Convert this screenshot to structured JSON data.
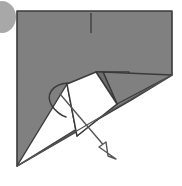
{
  "figure": {
    "type": "origami-step",
    "canvas": {
      "width": 182,
      "height": 186,
      "background": "#ffffff"
    },
    "palette": {
      "paper_front": "#808080",
      "paper_shadow": "#6e6e6e",
      "paper_back": "#ffffff",
      "outline": "#3a3a3a",
      "marker_circle": "#a8a8a8",
      "arrow_stroke": "#555555"
    },
    "shapes": {
      "marker_circle": {
        "label": "step-marker-circle",
        "cx": 2,
        "cy": 17,
        "rx": 14,
        "ry": 16,
        "fill": "#a8a8a8"
      },
      "main_sheet": {
        "label": "folded-paper-body",
        "points": "17,11 172,11 172,75 131,100 17,166",
        "fill": "#808080",
        "stroke": "#3a3a3a"
      },
      "crease_mark": {
        "label": "vertical-crease-mark",
        "x1": 91,
        "y1": 13,
        "x2": 91,
        "y2": 33,
        "stroke": "#3a3a3a"
      },
      "white_flap_main": {
        "label": "white-flap-kite",
        "points": "67,84 96,72 117,104 77,136",
        "fill": "#ffffff",
        "stroke": "#3a3a3a"
      },
      "white_flap_left": {
        "label": "white-flap-lower-wedge",
        "points": "17,166 67,84 77,136 117,104",
        "fill": "#ffffff",
        "stroke": "#3a3a3a"
      },
      "white_flap_right": {
        "label": "white-flap-right-wedge",
        "points": "96,72 129,72 117,104",
        "fill": "#ffffff",
        "stroke": "#3a3a3a"
      },
      "gray_wedge_a": {
        "label": "gray-folded-triangle-left",
        "points": "103,72 117,104 96,72",
        "fill": "#6e6e6e",
        "stroke": "#3a3a3a"
      },
      "gray_wedge_b": {
        "label": "gray-folded-triangle-right",
        "points": "103,72 172,75 117,104",
        "fill": "#808080",
        "stroke": "#3a3a3a"
      },
      "curved_hook": {
        "label": "curved-fold-arc",
        "path": "M 68,83 C 52,84 45,95 52,106 C 57,113 63,116 66,117",
        "stroke": "#3a3a3a"
      },
      "fold_arrow": {
        "label": "fold-direction-arrow",
        "shaft": {
          "x1": 60,
          "y1": 94,
          "x2": 106,
          "y2": 148
        },
        "head_points": "116,159 99,147 106,142 108,156",
        "stroke": "#555555"
      },
      "guide_line": {
        "label": "alignment-guide-line",
        "x1": 17,
        "y1": 166,
        "x2": 172,
        "y2": 75,
        "stroke": "#555555"
      }
    }
  }
}
